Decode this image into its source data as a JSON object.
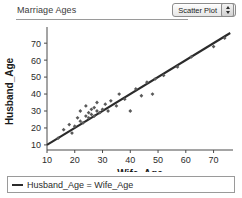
{
  "header": {
    "title": "Marriage Ages",
    "plot_type_selected": "Scatter Plot",
    "stepper_icon_up": "stepper-up-icon",
    "stepper_icon_down": "stepper-down-icon"
  },
  "legend": {
    "entries": [
      {
        "label": "Husband_Age = Wife_Age",
        "marker": "line",
        "color": "#2b2b2b"
      }
    ]
  },
  "chart_data": {
    "type": "scatter",
    "title": "Marriage Ages",
    "xlabel": "Wife_Age",
    "ylabel": "Husband_Age",
    "xlim": [
      10,
      77
    ],
    "ylim": [
      7,
      76
    ],
    "xticks": [
      10,
      20,
      30,
      40,
      50,
      60,
      70
    ],
    "yticks": [
      10,
      20,
      30,
      40,
      50,
      60,
      70
    ],
    "grid": false,
    "legend_position": "below-plot",
    "point_color": "#5a5a5a",
    "line_color": "#2b2b2b",
    "marker": "diamond",
    "series": [
      {
        "name": "Couples",
        "type": "scatter",
        "points": [
          [
            14,
            14
          ],
          [
            16,
            19
          ],
          [
            18,
            22
          ],
          [
            19,
            17
          ],
          [
            20,
            21
          ],
          [
            21,
            26
          ],
          [
            22,
            24
          ],
          [
            22,
            30
          ],
          [
            23,
            23
          ],
          [
            24,
            27
          ],
          [
            24,
            33
          ],
          [
            25,
            26
          ],
          [
            25,
            29
          ],
          [
            26,
            28
          ],
          [
            26,
            31
          ],
          [
            27,
            27
          ],
          [
            27,
            32
          ],
          [
            28,
            30
          ],
          [
            28,
            35
          ],
          [
            29,
            29
          ],
          [
            30,
            31
          ],
          [
            31,
            34
          ],
          [
            32,
            30
          ],
          [
            33,
            36
          ],
          [
            35,
            33
          ],
          [
            36,
            40
          ],
          [
            38,
            37
          ],
          [
            40,
            30
          ],
          [
            42,
            43
          ],
          [
            44,
            39
          ],
          [
            46,
            47
          ],
          [
            48,
            40
          ],
          [
            49,
            49
          ],
          [
            52,
            51
          ],
          [
            57,
            56
          ],
          [
            62,
            62
          ],
          [
            70,
            68
          ],
          [
            74,
            73
          ]
        ]
      },
      {
        "name": "Husband_Age = Wife_Age",
        "type": "line",
        "points": [
          [
            10,
            10
          ],
          [
            76,
            76
          ]
        ]
      }
    ]
  }
}
